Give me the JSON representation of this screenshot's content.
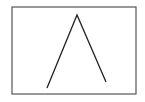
{
  "diagram": {
    "frame": {
      "x": 12,
      "y": 7,
      "width": 124,
      "height": 87,
      "stroke": "#555555"
    },
    "peak_line": {
      "points": [
        [
          47,
          88
        ],
        [
          77,
          15
        ],
        [
          106,
          82
        ]
      ],
      "stroke": "#222222"
    },
    "background": "#ffffff"
  }
}
